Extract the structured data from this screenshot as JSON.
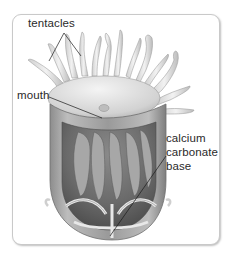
{
  "diagram": {
    "labels": {
      "tentacles": "tentacles",
      "mouth": "mouth",
      "base_line1": "calcium",
      "base_line2": "carbonate",
      "base_line3": "base"
    },
    "colors": {
      "card_border": "#c9c9c9",
      "label_text": "#2a2a2a",
      "leader_line": "#1a1a1a",
      "body_light": "#e6e6e6",
      "body_mid": "#a8a8a8",
      "body_dark": "#555555"
    }
  }
}
